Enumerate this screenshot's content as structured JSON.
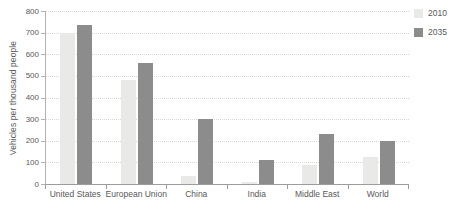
{
  "chart_data": {
    "type": "bar",
    "title": "",
    "ylabel": "Vehicles per thousand people",
    "xlabel": "",
    "categories": [
      "United States",
      "European Union",
      "China",
      "India",
      "Middle East",
      "World"
    ],
    "series": [
      {
        "name": "2010",
        "color": "#e9e9e7",
        "values": [
          700,
          480,
          35,
          10,
          90,
          125
        ]
      },
      {
        "name": "2035",
        "color": "#8c8c8c",
        "values": [
          735,
          560,
          300,
          110,
          230,
          200
        ]
      }
    ],
    "ylim": [
      0,
      800
    ],
    "ytick_step": 100,
    "grid": true,
    "gridline_style": "dotted",
    "legend_position": "top-right"
  },
  "colors": {
    "background": "#ffffff",
    "gridline": "#d8d8d6",
    "axis": "#9c9c9c",
    "text": "#595959",
    "series_2010": "#e9e9e7",
    "series_2035": "#8c8c8c"
  }
}
